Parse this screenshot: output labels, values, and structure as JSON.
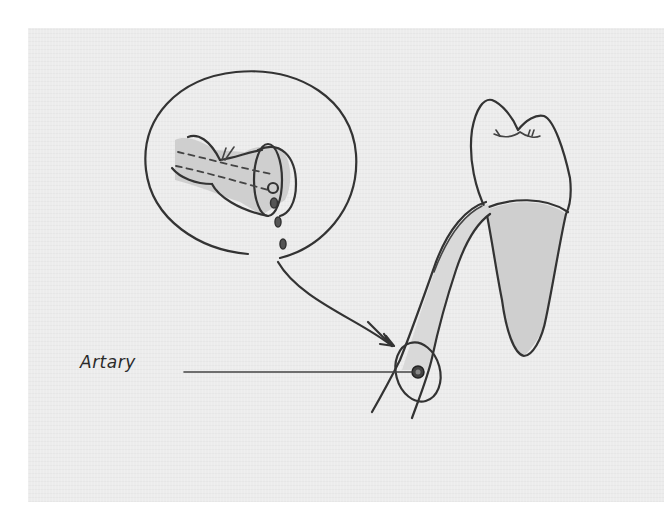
{
  "figure": {
    "labels": {
      "artery": "Artary"
    },
    "colors": {
      "paper": "#ececec",
      "ink": "#333333",
      "shading": "#cfcfcf",
      "background": "#ffffff"
    },
    "elements": [
      "inset-magnifier-circle",
      "severed-vessel",
      "blood-drops",
      "pointer-arrow",
      "tooth-crown",
      "tooth-root",
      "nerve-bundle",
      "artery-cross-section",
      "artery-leader-line"
    ]
  }
}
